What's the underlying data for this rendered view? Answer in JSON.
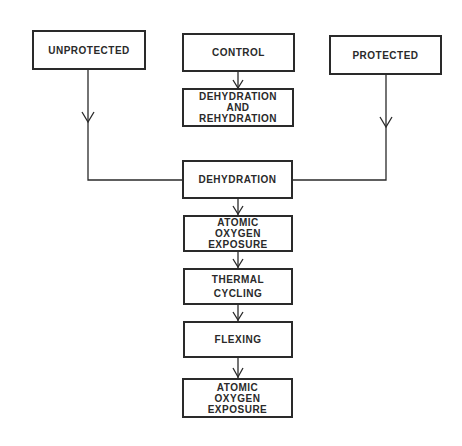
{
  "diagram": {
    "inputs": {
      "unprotected": [
        "UNPROTECTED"
      ],
      "control": [
        "CONTROL"
      ],
      "protected": [
        "PROTECTED"
      ]
    },
    "control_branch": {
      "dehydration_rehydration": [
        "DEHYDRATION",
        "AND",
        "REHYDRATION"
      ]
    },
    "main_sequence": [
      {
        "lines": [
          "DEHYDRATION"
        ]
      },
      {
        "lines": [
          "ATOMIC",
          "OXYGEN",
          "EXPOSURE"
        ]
      },
      {
        "lines": [
          "THERMAL",
          "CYCLING"
        ]
      },
      {
        "lines": [
          "FLEXING"
        ]
      },
      {
        "lines": [
          "ATOMIC",
          "OXYGEN",
          "EXPOSURE"
        ]
      }
    ],
    "colors": {
      "stroke": "#2a2a2a",
      "background": "#ffffff"
    }
  }
}
